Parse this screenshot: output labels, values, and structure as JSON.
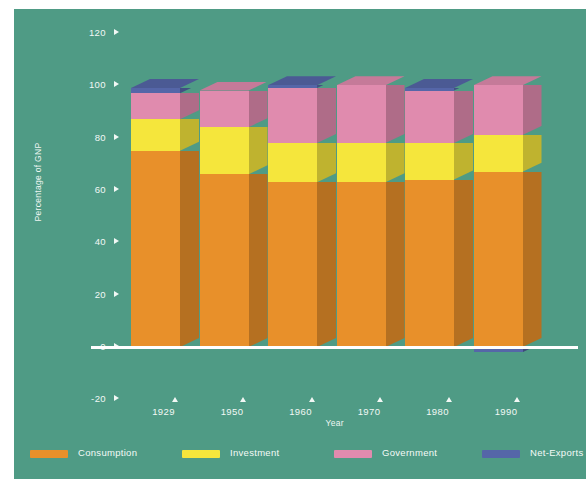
{
  "chart_data": {
    "type": "bar",
    "subtype": "stacked-3d-column",
    "title": "",
    "xlabel": "Year",
    "ylabel": "Percentage of GNP",
    "categories": [
      "1929",
      "1950",
      "1960",
      "1970",
      "1980",
      "1990"
    ],
    "ylim": [
      -20,
      120
    ],
    "yticks": [
      "120",
      "100",
      "80",
      "60",
      "40",
      "20",
      "0",
      "-20"
    ],
    "ytick_values": [
      120,
      100,
      80,
      60,
      40,
      20,
      0,
      -20
    ],
    "grid": false,
    "legend_position": "bottom",
    "series": [
      {
        "name": "Consumption",
        "color": "#e8902a",
        "values": [
          75,
          66,
          63,
          63,
          64,
          67
        ]
      },
      {
        "name": "Investment",
        "color": "#f5e63c",
        "values": [
          12,
          18,
          15,
          15,
          14,
          14
        ]
      },
      {
        "name": "Government",
        "color": "#e08bae",
        "values": [
          10,
          14,
          21,
          22,
          20,
          19
        ]
      },
      {
        "name": "Net-Exports",
        "color": "#5566a8",
        "values": [
          2,
          0,
          1,
          0,
          1,
          -2
        ]
      }
    ]
  },
  "legend": {
    "items": [
      {
        "label": "Consumption",
        "color": "#e8902a"
      },
      {
        "label": "Investment",
        "color": "#f5e63c"
      },
      {
        "label": "Government",
        "color": "#e08bae"
      },
      {
        "label": "Net-Exports",
        "color": "#5566a8"
      }
    ]
  },
  "colors": {
    "background": "#4f9b85",
    "axis_text": "#f2f8f5",
    "zero_line": "#ffffff"
  }
}
